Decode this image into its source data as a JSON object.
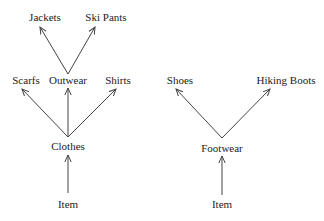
{
  "diagram": {
    "type": "taxonomy-tree",
    "trees": [
      {
        "root": "Item",
        "nodes": [
          {
            "id": "item_left",
            "label": "Item",
            "x": 68,
            "y": 207
          },
          {
            "id": "clothes",
            "label": "Clothes",
            "x": 68,
            "y": 149
          },
          {
            "id": "scarfs",
            "label": "Scarfs",
            "x": 26,
            "y": 83
          },
          {
            "id": "outwear",
            "label": "Outwear",
            "x": 68,
            "y": 83
          },
          {
            "id": "shirts",
            "label": "Shirts",
            "x": 118,
            "y": 83
          },
          {
            "id": "jackets",
            "label": "Jackets",
            "x": 45,
            "y": 21
          },
          {
            "id": "ski_pants",
            "label": "Ski Pants",
            "x": 106,
            "y": 21
          }
        ],
        "edges": [
          {
            "from": "item_left",
            "to": "clothes"
          },
          {
            "from": "clothes",
            "to": "scarfs"
          },
          {
            "from": "clothes",
            "to": "outwear"
          },
          {
            "from": "clothes",
            "to": "shirts"
          },
          {
            "from": "outwear",
            "to": "jackets"
          },
          {
            "from": "outwear",
            "to": "ski_pants"
          }
        ]
      },
      {
        "root": "Item",
        "nodes": [
          {
            "id": "item_right",
            "label": "Item",
            "x": 222,
            "y": 207
          },
          {
            "id": "footwear",
            "label": "Footwear",
            "x": 222,
            "y": 151
          },
          {
            "id": "shoes",
            "label": "Shoes",
            "x": 180,
            "y": 83
          },
          {
            "id": "hiking_boots",
            "label": "Hiking Boots",
            "x": 286,
            "y": 83
          }
        ],
        "edges": [
          {
            "from": "item_right",
            "to": "footwear"
          },
          {
            "from": "footwear",
            "to": "shoes"
          },
          {
            "from": "footwear",
            "to": "hiking_boots"
          }
        ]
      }
    ]
  },
  "labels": {
    "jackets": "Jackets",
    "ski_pants": "Ski Pants",
    "scarfs": "Scarfs",
    "outwear": "Outwear",
    "shirts": "Shirts",
    "clothes": "Clothes",
    "item_left": "Item",
    "shoes": "Shoes",
    "hiking_boots": "Hiking Boots",
    "footwear": "Footwear",
    "item_right": "Item"
  }
}
